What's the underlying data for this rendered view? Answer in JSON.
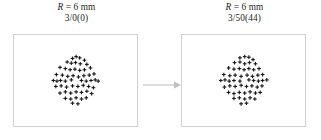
{
  "figure": {
    "background_color": "#ffffff",
    "box_border_color": "#d2d2d2",
    "marker_color": "#1a1a1a",
    "arrow_color": "#bfbfbf"
  },
  "panels": [
    {
      "id": "left",
      "caption_line1_symbol": "R",
      "caption_line1_rest": " = 6 mm",
      "caption_line1": "R = 6 mm",
      "caption_line2": "3/0(0)",
      "marker_glyph": "cross",
      "marker_count": 55
    },
    {
      "id": "right",
      "caption_line1_symbol": "R",
      "caption_line1_rest": " = 6 mm",
      "caption_line1": "R = 6 mm",
      "caption_line2": "3/50(44)",
      "marker_glyph": "cross",
      "marker_count": 55
    }
  ],
  "arrow": {
    "direction": "right",
    "color": "#bfbfbf"
  },
  "chart_data": {
    "type": "scatter",
    "title": "",
    "xlabel": "",
    "ylabel": "",
    "grid": false,
    "legend": null,
    "axis_visible": false,
    "xlim": [
      -1,
      1
    ],
    "ylim": [
      -1,
      1
    ],
    "marker": "plus",
    "series": [
      {
        "name": "R = 6 mm, 3/0(0)",
        "panel": "left",
        "points": [
          [
            -0.1,
            0.74
          ],
          [
            0.02,
            0.8
          ],
          [
            0.14,
            0.76
          ],
          [
            0.3,
            0.68
          ],
          [
            -0.28,
            0.62
          ],
          [
            -0.14,
            0.58
          ],
          [
            0.0,
            0.6
          ],
          [
            0.16,
            0.56
          ],
          [
            0.38,
            0.54
          ],
          [
            -0.52,
            0.44
          ],
          [
            -0.34,
            0.4
          ],
          [
            -0.18,
            0.36
          ],
          [
            -0.02,
            0.38
          ],
          [
            0.14,
            0.34
          ],
          [
            0.3,
            0.36
          ],
          [
            0.5,
            0.42
          ],
          [
            -0.64,
            0.2
          ],
          [
            -0.44,
            0.18
          ],
          [
            -0.26,
            0.14
          ],
          [
            -0.08,
            0.16
          ],
          [
            0.1,
            0.12
          ],
          [
            0.28,
            0.16
          ],
          [
            0.46,
            0.18
          ],
          [
            0.62,
            0.22
          ],
          [
            -0.74,
            0.0
          ],
          [
            -0.62,
            -0.02
          ],
          [
            -0.5,
            0.0
          ],
          [
            -0.34,
            -0.02
          ],
          [
            -0.14,
            0.02
          ],
          [
            0.2,
            0.0
          ],
          [
            0.36,
            -0.02
          ],
          [
            0.52,
            0.0
          ],
          [
            0.66,
            0.02
          ],
          [
            0.76,
            -0.02
          ],
          [
            -0.66,
            -0.2
          ],
          [
            -0.48,
            -0.18
          ],
          [
            -0.3,
            -0.22
          ],
          [
            -0.1,
            -0.18
          ],
          [
            0.08,
            -0.2
          ],
          [
            0.26,
            -0.16
          ],
          [
            0.44,
            -0.2
          ],
          [
            0.6,
            -0.24
          ],
          [
            -0.52,
            -0.42
          ],
          [
            -0.34,
            -0.38
          ],
          [
            -0.16,
            -0.42
          ],
          [
            0.02,
            -0.38
          ],
          [
            0.2,
            -0.4
          ],
          [
            0.38,
            -0.36
          ],
          [
            0.54,
            -0.44
          ],
          [
            -0.34,
            -0.6
          ],
          [
            -0.16,
            -0.62
          ],
          [
            0.02,
            -0.58
          ],
          [
            0.2,
            -0.62
          ],
          [
            0.36,
            -0.58
          ],
          [
            -0.1,
            -0.76
          ],
          [
            0.08,
            -0.78
          ]
        ]
      },
      {
        "name": "R = 6 mm, 3/50(44)",
        "panel": "right",
        "points": [
          [
            -0.12,
            0.76
          ],
          [
            0.04,
            0.8
          ],
          [
            0.18,
            0.78
          ],
          [
            0.32,
            0.7
          ],
          [
            -0.3,
            0.6
          ],
          [
            -0.12,
            0.62
          ],
          [
            0.04,
            0.56
          ],
          [
            0.2,
            0.6
          ],
          [
            0.4,
            0.56
          ],
          [
            -0.5,
            0.42
          ],
          [
            -0.32,
            0.38
          ],
          [
            -0.14,
            0.4
          ],
          [
            0.02,
            0.36
          ],
          [
            0.18,
            0.4
          ],
          [
            0.34,
            0.36
          ],
          [
            0.52,
            0.4
          ],
          [
            -0.66,
            0.2
          ],
          [
            -0.46,
            0.16
          ],
          [
            -0.28,
            0.18
          ],
          [
            -0.08,
            0.14
          ],
          [
            0.12,
            0.18
          ],
          [
            0.3,
            0.14
          ],
          [
            0.48,
            0.18
          ],
          [
            0.64,
            0.2
          ],
          [
            -0.76,
            0.0
          ],
          [
            -0.62,
            0.02
          ],
          [
            -0.48,
            -0.02
          ],
          [
            -0.32,
            0.0
          ],
          [
            -0.12,
            -0.02
          ],
          [
            0.18,
            0.02
          ],
          [
            0.34,
            0.0
          ],
          [
            0.5,
            -0.02
          ],
          [
            0.64,
            0.0
          ],
          [
            0.78,
            0.02
          ],
          [
            -0.64,
            -0.22
          ],
          [
            -0.46,
            -0.18
          ],
          [
            -0.28,
            -0.2
          ],
          [
            -0.08,
            -0.16
          ],
          [
            0.1,
            -0.2
          ],
          [
            0.28,
            -0.18
          ],
          [
            0.46,
            -0.22
          ],
          [
            0.62,
            -0.18
          ],
          [
            -0.5,
            -0.4
          ],
          [
            -0.32,
            -0.44
          ],
          [
            -0.14,
            -0.4
          ],
          [
            0.04,
            -0.42
          ],
          [
            0.22,
            -0.38
          ],
          [
            0.4,
            -0.42
          ],
          [
            0.56,
            -0.4
          ],
          [
            -0.32,
            -0.6
          ],
          [
            -0.14,
            -0.58
          ],
          [
            0.04,
            -0.62
          ],
          [
            0.22,
            -0.58
          ],
          [
            0.38,
            -0.62
          ],
          [
            -0.08,
            -0.78
          ],
          [
            0.1,
            -0.76
          ]
        ]
      }
    ]
  }
}
